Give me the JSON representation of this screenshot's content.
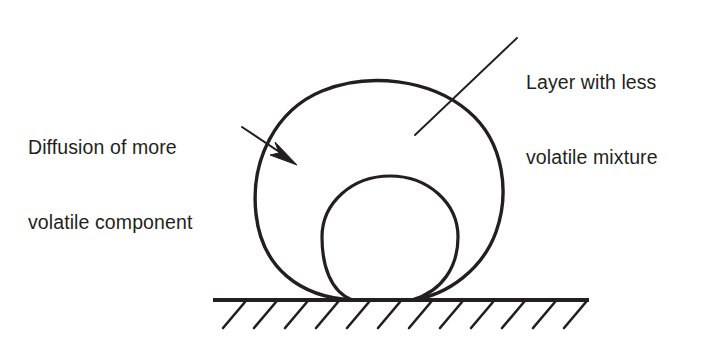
{
  "figure": {
    "background_color": "#ffffff",
    "ink_color": "#231f20",
    "width": 718,
    "height": 344
  },
  "annotations": {
    "right_label": {
      "name": "layer-with-less-volatile-mixture",
      "line1": "Layer with less",
      "line2": "volatile mixture",
      "full_text": "Layer with less volatile mixture",
      "leader": {
        "type": "plain-line",
        "from_x": 517,
        "from_y": 38,
        "to_x": 415,
        "to_y": 135
      }
    },
    "left_label": {
      "name": "diffusion-of-more-volatile-component",
      "line1": "Diffusion of more",
      "line2": "volatile component",
      "full_text": "Diffusion of more volatile component",
      "leader": {
        "type": "arrow",
        "from_x": 242,
        "from_y": 127,
        "to_x": 293,
        "to_y": 161
      }
    }
  },
  "shapes": {
    "outer_drop": {
      "name": "outer-droplet-less-volatile-layer",
      "description": "large outer droplet outline (layer with less volatile mixture)",
      "center_x": 379,
      "center_y": 192,
      "radius_x": 124,
      "radius_y": 110,
      "stroke_width": 3.4
    },
    "inner_drop": {
      "name": "inner-droplet-core",
      "description": "inner circular core of the droplet",
      "center_x": 390,
      "center_y": 237,
      "radius_x": 68,
      "radius_y": 61,
      "stroke_width": 3.2
    },
    "surface": {
      "name": "solid-surface-line",
      "line_y": 300,
      "line_x_start": 213,
      "line_x_end": 589,
      "stroke_width": 4.2,
      "hatch": {
        "count": 12,
        "spacing": 31,
        "first_x": 245,
        "dx": -22,
        "dy": 26,
        "stroke_width": 2.6
      }
    },
    "contact": {
      "left_contact_x": 352,
      "right_contact_x": 412,
      "contact_y": 300
    }
  }
}
